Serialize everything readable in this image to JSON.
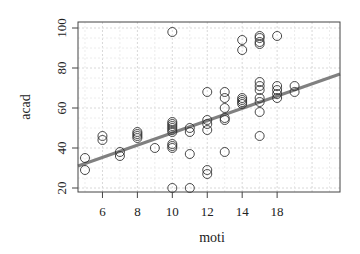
{
  "chart_data": {
    "type": "scatter",
    "title": "",
    "xlabel": "moti",
    "ylabel": "acad",
    "xlim": [
      4.6,
      19.6
    ],
    "ylim": [
      18,
      103
    ],
    "x_ticks": [
      6,
      8,
      10,
      12,
      14,
      16
    ],
    "x_tick_labels": [
      "6",
      "8",
      "10",
      "12",
      "14",
      "18"
    ],
    "y_ticks": [
      20,
      40,
      60,
      80,
      100
    ],
    "y_tick_labels": [
      "20",
      "40",
      "60",
      "80",
      "100"
    ],
    "grid": true,
    "legend": null,
    "regression_line": {
      "x": [
        4.6,
        19.6
      ],
      "y": [
        31,
        77
      ],
      "color": "#808080"
    },
    "points": [
      {
        "x": 5,
        "y": 35
      },
      {
        "x": 5,
        "y": 29
      },
      {
        "x": 6,
        "y": 46
      },
      {
        "x": 6,
        "y": 44
      },
      {
        "x": 7,
        "y": 38
      },
      {
        "x": 7,
        "y": 36
      },
      {
        "x": 8,
        "y": 48
      },
      {
        "x": 8,
        "y": 47
      },
      {
        "x": 8,
        "y": 46
      },
      {
        "x": 8,
        "y": 45
      },
      {
        "x": 9,
        "y": 40
      },
      {
        "x": 10,
        "y": 98
      },
      {
        "x": 10,
        "y": 53
      },
      {
        "x": 10,
        "y": 52
      },
      {
        "x": 10,
        "y": 51
      },
      {
        "x": 10,
        "y": 50
      },
      {
        "x": 10,
        "y": 49
      },
      {
        "x": 10,
        "y": 48
      },
      {
        "x": 10,
        "y": 42
      },
      {
        "x": 10,
        "y": 41
      },
      {
        "x": 10,
        "y": 40
      },
      {
        "x": 10,
        "y": 20
      },
      {
        "x": 11,
        "y": 50
      },
      {
        "x": 11,
        "y": 48
      },
      {
        "x": 11,
        "y": 37
      },
      {
        "x": 11,
        "y": 20
      },
      {
        "x": 12,
        "y": 68
      },
      {
        "x": 12,
        "y": 54
      },
      {
        "x": 12,
        "y": 52
      },
      {
        "x": 12,
        "y": 49
      },
      {
        "x": 12,
        "y": 29
      },
      {
        "x": 12,
        "y": 27
      },
      {
        "x": 13,
        "y": 68
      },
      {
        "x": 13,
        "y": 65
      },
      {
        "x": 13,
        "y": 60
      },
      {
        "x": 13,
        "y": 55
      },
      {
        "x": 13,
        "y": 54
      },
      {
        "x": 13,
        "y": 38
      },
      {
        "x": 14,
        "y": 94
      },
      {
        "x": 14,
        "y": 89
      },
      {
        "x": 14,
        "y": 65
      },
      {
        "x": 14,
        "y": 64
      },
      {
        "x": 14,
        "y": 63
      },
      {
        "x": 14,
        "y": 62
      },
      {
        "x": 15,
        "y": 96
      },
      {
        "x": 15,
        "y": 95
      },
      {
        "x": 15,
        "y": 93
      },
      {
        "x": 15,
        "y": 92
      },
      {
        "x": 15,
        "y": 73
      },
      {
        "x": 15,
        "y": 71
      },
      {
        "x": 15,
        "y": 69
      },
      {
        "x": 15,
        "y": 65
      },
      {
        "x": 15,
        "y": 63
      },
      {
        "x": 15,
        "y": 58
      },
      {
        "x": 15,
        "y": 46
      },
      {
        "x": 16,
        "y": 96
      },
      {
        "x": 16,
        "y": 71
      },
      {
        "x": 16,
        "y": 69
      },
      {
        "x": 16,
        "y": 67
      },
      {
        "x": 16,
        "y": 65
      },
      {
        "x": 17,
        "y": 71
      },
      {
        "x": 17,
        "y": 68
      }
    ],
    "point_color": "#333333",
    "plot_box": {
      "left": 78,
      "top": 22,
      "right": 340,
      "bottom": 192
    }
  }
}
